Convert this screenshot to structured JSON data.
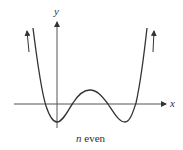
{
  "diagram": {
    "axis_labels": {
      "x": "x",
      "y": "y"
    },
    "caption": {
      "var": "n",
      "text": " even"
    },
    "curve": {
      "description": "Even-degree polynomial with two local minima below x-axis, one local maximum above, four real roots; both ends rise to +infinity",
      "end_behavior": {
        "left": "up",
        "right": "up"
      }
    },
    "colors": {
      "stroke": "#333333",
      "background": "#ffffff"
    }
  }
}
